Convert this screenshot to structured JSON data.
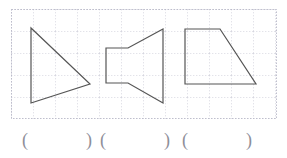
{
  "page": {
    "background_color": "#ffffff",
    "width": 287,
    "height": 158
  },
  "grid": {
    "label": "dotted graph paper grid",
    "x": 11,
    "y": 9,
    "width": 266,
    "height": 110,
    "cell_size": 22,
    "line_color": "#c9c9d6",
    "border_color": "#b9b9c8",
    "style": "dotted"
  },
  "shapes": {
    "stroke_color": "#555555",
    "fill": "none",
    "stroke_width": 1.2,
    "items": [
      {
        "name": "triangle",
        "description": "right triangle pointing to the right",
        "sides": 3,
        "points": "31,28 31,103 90,84"
      },
      {
        "name": "megaphone-hexagon",
        "description": "megaphone shaped hexagon, narrow flat left end opening to a tall right end",
        "sides": 6,
        "points": "106,48 128,48 163,29 163,103 128,83 106,83"
      },
      {
        "name": "right-trapezoid",
        "description": "right trapezoid with vertical left side and slanted right side",
        "sides": 4,
        "points": "185,29 220,29 256,84 185,84"
      }
    ]
  },
  "answers": {
    "open_paren": "(",
    "close_paren": ")",
    "slots": [
      {
        "id": "slot-1",
        "value": "",
        "for_shape": "triangle"
      },
      {
        "id": "slot-2",
        "value": "",
        "for_shape": "megaphone-hexagon"
      },
      {
        "id": "slot-3",
        "value": "",
        "for_shape": "right-trapezoid"
      }
    ]
  }
}
